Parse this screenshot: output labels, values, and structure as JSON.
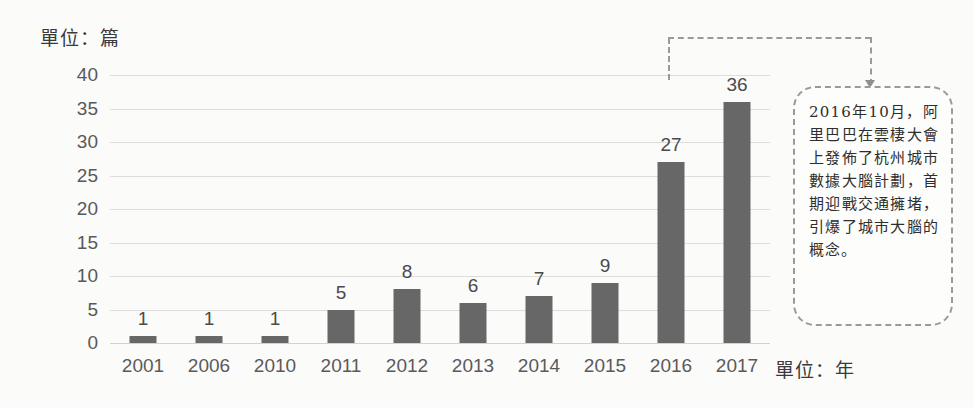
{
  "chart_data": {
    "type": "bar",
    "title": "",
    "subtitle": "",
    "xlabel": "單位：年",
    "ylabel": "單位：篇",
    "categories": [
      "2001",
      "2006",
      "2010",
      "2011",
      "2012",
      "2013",
      "2014",
      "2015",
      "2016",
      "2017"
    ],
    "values": [
      1,
      1,
      1,
      5,
      8,
      6,
      7,
      9,
      27,
      36
    ],
    "series": [
      {
        "name": "",
        "values": [
          1,
          1,
          1,
          5,
          8,
          6,
          7,
          9,
          27,
          36
        ]
      }
    ],
    "ylim": [
      0,
      40
    ],
    "yticks": [
      "0",
      "5",
      "10",
      "15",
      "20",
      "25",
      "30",
      "35",
      "40"
    ],
    "ytick_values": [
      0,
      5,
      10,
      15,
      20,
      25,
      30,
      35,
      40
    ],
    "grid": true,
    "legend": false,
    "legend_position": "none",
    "bar_color": "#676767",
    "gridline_color": "#dedddb",
    "data_labels": [
      "1",
      "1",
      "1",
      "5",
      "8",
      "6",
      "7",
      "9",
      "27",
      "36"
    ],
    "annotations": [
      {
        "target_category": "2016",
        "text": "2016年10月，阿里巴巴在雲棲大會上發佈了杭州城市數據大腦計劃，首期迎戰交通擁堵，引爆了城市大腦的概念。",
        "style": "dashed-rounded-callout",
        "border_color": "#9a9a9a"
      }
    ]
  },
  "axes": {
    "y_unit_caption": "單位：篇",
    "x_unit_caption": "單位：年"
  },
  "callout": {
    "text": "2016年10月，阿里巴巴在雲棲大會上發佈了杭州城市數據大腦計劃，首期迎戰交通擁堵，引爆了城市大腦的概念。"
  }
}
